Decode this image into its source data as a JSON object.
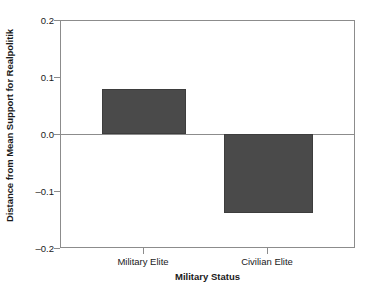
{
  "chart_data": {
    "type": "bar",
    "title": "",
    "categories": [
      "Military Elite",
      "Civilian Elite"
    ],
    "values": [
      0.08,
      -0.14
    ],
    "xlabel": "Military Status",
    "ylabel": "Distance from Mean Support for Realpolitik",
    "ylim": [
      -0.2,
      0.2
    ],
    "yticks": [
      "0.2",
      "0.1",
      "0.0",
      "–0.1",
      "–0.2"
    ],
    "ytick_values": [
      0.2,
      0.1,
      0.0,
      -0.1,
      -0.2
    ],
    "grid": false,
    "legend": false,
    "zero_reference_line": true,
    "series": [
      {
        "name": "Distance from Mean Support for Realpolitik",
        "values": [
          0.08,
          -0.14
        ],
        "color": "#4a4a4a"
      }
    ]
  },
  "axes": {
    "y_title": "Distance from Mean Support for Realpolitik",
    "x_title": "Military Status",
    "y_tick_labels": [
      "0.2",
      "0.1",
      "0.0",
      "–0.1",
      "–0.2"
    ],
    "x_tick_labels": [
      "Military Elite",
      "Civilian Elite"
    ]
  },
  "bars": [
    {
      "label": "Military Elite",
      "value": 0.08
    },
    {
      "label": "Civilian Elite",
      "value": -0.14
    }
  ],
  "colors": {
    "bar_fill": "#4a4a4a",
    "bar_edge": "#3d3d3d",
    "axis_line": "#8c8c8c",
    "text": "#1a1a1a",
    "background": "#ffffff"
  }
}
